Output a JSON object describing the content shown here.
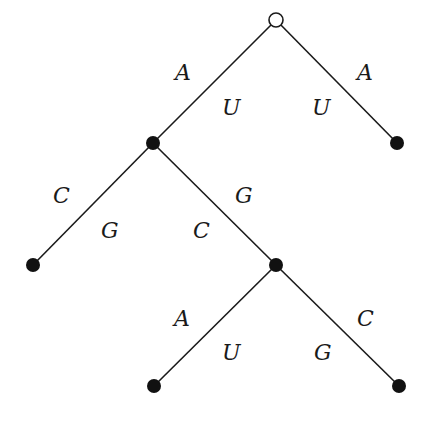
{
  "diagram": {
    "type": "binary-tree",
    "nodes": [
      {
        "id": "root",
        "x": 276,
        "y": 20,
        "kind": "open"
      },
      {
        "id": "n1",
        "x": 153,
        "y": 143,
        "kind": "filled"
      },
      {
        "id": "n2",
        "x": 397,
        "y": 143,
        "kind": "filled"
      },
      {
        "id": "n3",
        "x": 33,
        "y": 265,
        "kind": "filled"
      },
      {
        "id": "n4",
        "x": 276,
        "y": 265,
        "kind": "filled"
      },
      {
        "id": "n5",
        "x": 154,
        "y": 386,
        "kind": "filled"
      },
      {
        "id": "n6",
        "x": 399,
        "y": 386,
        "kind": "filled"
      }
    ],
    "edges": [
      {
        "from": "root",
        "to": "n1",
        "outer_label": "A",
        "inner_label": "U"
      },
      {
        "from": "root",
        "to": "n2",
        "outer_label": "A",
        "inner_label": "U"
      },
      {
        "from": "n1",
        "to": "n3",
        "outer_label": "C",
        "inner_label": "G"
      },
      {
        "from": "n1",
        "to": "n4",
        "outer_label": "G",
        "inner_label": "C"
      },
      {
        "from": "n4",
        "to": "n5",
        "outer_label": "A",
        "inner_label": "U"
      },
      {
        "from": "n4",
        "to": "n6",
        "outer_label": "C",
        "inner_label": "G"
      }
    ],
    "labels": {
      "e0_outer": "A",
      "e0_inner": "U",
      "e1_outer": "A",
      "e1_inner": "U",
      "e2_outer": "C",
      "e2_inner": "G",
      "e3_outer": "G",
      "e3_inner": "C",
      "e4_outer": "A",
      "e4_inner": "U",
      "e5_outer": "C",
      "e5_inner": "G"
    }
  }
}
